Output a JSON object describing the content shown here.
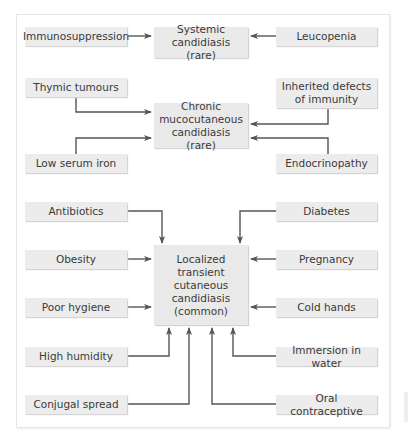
{
  "diagram": {
    "title": "",
    "colors": {
      "box_fill": "#ececec",
      "text": "#3a3a3a",
      "line": "#555555",
      "frame": "#e6e6e6"
    },
    "outcomes": {
      "systemic": "Systemic\ncandidiasis (rare)",
      "chronic": "Chronic\nmucocutaneous\ncandidiasis (rare)",
      "localized": "Localized\ntransient\ncutaneous\ncandidiasis\n(common)"
    },
    "causes": {
      "immunosuppression": "Immunosuppression",
      "leucopenia": "Leucopenia",
      "thymic_tumours": "Thymic tumours",
      "inherited_defects": "Inherited defects\nof immunity",
      "low_serum_iron": "Low serum iron",
      "endocrinopathy": "Endocrinopathy",
      "antibiotics": "Antibiotics",
      "diabetes": "Diabetes",
      "obesity": "Obesity",
      "pregnancy": "Pregnancy",
      "poor_hygiene": "Poor hygiene",
      "cold_hands": "Cold hands",
      "high_humidity": "High humidity",
      "immersion_in_water": "Immersion in water",
      "conjugal_spread": "Conjugal spread",
      "oral_contraceptive": "Oral contraceptive"
    },
    "edges": [
      [
        "Immunosuppression",
        "Systemic candidiasis (rare)"
      ],
      [
        "Leucopenia",
        "Systemic candidiasis (rare)"
      ],
      [
        "Thymic tumours",
        "Chronic mucocutaneous candidiasis (rare)"
      ],
      [
        "Inherited defects of immunity",
        "Chronic mucocutaneous candidiasis (rare)"
      ],
      [
        "Low serum iron",
        "Chronic mucocutaneous candidiasis (rare)"
      ],
      [
        "Endocrinopathy",
        "Chronic mucocutaneous candidiasis (rare)"
      ],
      [
        "Antibiotics",
        "Localized transient cutaneous candidiasis (common)"
      ],
      [
        "Diabetes",
        "Localized transient cutaneous candidiasis (common)"
      ],
      [
        "Obesity",
        "Localized transient cutaneous candidiasis (common)"
      ],
      [
        "Pregnancy",
        "Localized transient cutaneous candidiasis (common)"
      ],
      [
        "Poor hygiene",
        "Localized transient cutaneous candidiasis (common)"
      ],
      [
        "Cold hands",
        "Localized transient cutaneous candidiasis (common)"
      ],
      [
        "High humidity",
        "Localized transient cutaneous candidiasis (common)"
      ],
      [
        "Immersion in water",
        "Localized transient cutaneous candidiasis (common)"
      ],
      [
        "Conjugal spread",
        "Localized transient cutaneous candidiasis (common)"
      ],
      [
        "Oral contraceptive",
        "Localized transient cutaneous candidiasis (common)"
      ]
    ]
  }
}
